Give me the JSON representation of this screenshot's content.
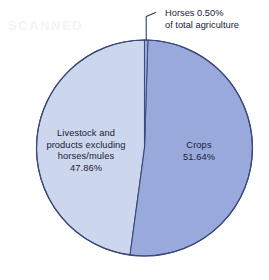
{
  "chart_data": {
    "type": "pie",
    "title": "",
    "subtitle": "",
    "categories": [
      "Crops",
      "Livestock and products excluding horses/mules",
      "Horses"
    ],
    "values": [
      51.64,
      47.86,
      0.5
    ],
    "value_unit": "%",
    "slices": [
      {
        "name": "Crops",
        "label": "Crops",
        "value": 51.64,
        "value_text": "51.64%",
        "color": "#9aa9db",
        "label_placement": "inside-right"
      },
      {
        "name": "Livestock and products excluding horses/mules",
        "label": "Livestock and\nproducts excluding\nhorses/mules",
        "value": 47.86,
        "value_text": "47.86%",
        "color": "#ccd6ec",
        "label_placement": "inside-left"
      },
      {
        "name": "Horses",
        "label": "Horses 0.50%\nof total agriculture",
        "value": 0.5,
        "value_text": "0.50%",
        "color": "#9aa9db",
        "label_placement": "callout-top-right"
      }
    ],
    "legend": "none",
    "grid": false,
    "total": 100.0,
    "border_color": "#39477a",
    "background_color": "#ffffff"
  },
  "labels": {
    "livestock": "Livestock and\nproducts excluding\nhorses/mules\n47.86%",
    "crops": "Crops\n51.64%",
    "horses_callout": "Horses 0.50%\nof total agriculture"
  },
  "artifact": {
    "ghost_text": "SCANNED"
  }
}
